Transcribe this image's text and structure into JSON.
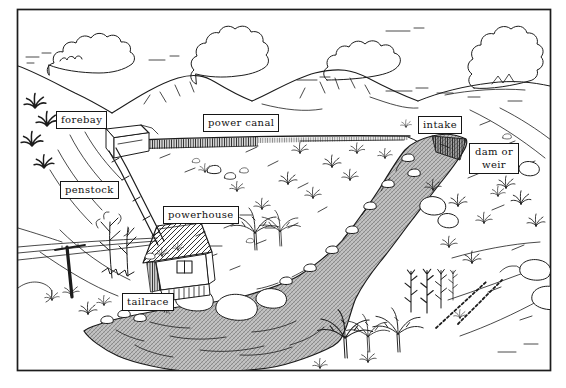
{
  "labels": {
    "forebay": "forebay",
    "power_canal": "power canal",
    "intake": "intake",
    "dam_or_weir": "dam or weir",
    "penstock": "penstock",
    "powerhouse": "powerhouse",
    "tailrace": "tailrace"
  },
  "colors": {
    "ink": "#1c1c1c",
    "paper": "#ffffff",
    "river_texture_gray": "#bdbdbd"
  }
}
